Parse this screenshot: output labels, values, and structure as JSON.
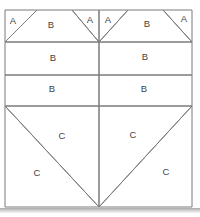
{
  "figure": {
    "kind": "quilt-block-piecing-diagram",
    "canvas": {
      "width": 200,
      "height": 217
    },
    "colors": {
      "background": "#ffffff",
      "line": "#7b7b7b",
      "label": "#3f3f3f",
      "shadow": "#a9a9a9"
    },
    "label_font_size": 9.5,
    "regions": [
      {
        "name": "top-left-corner-triangle",
        "label": "A",
        "points": "5,10 37,10 5,42",
        "lx": 13,
        "ly": 24
      },
      {
        "name": "top-left-trapezoid",
        "label": "B",
        "points": "37,10 72,10 99,42 5,42",
        "lx": 51,
        "ly": 28
      },
      {
        "name": "top-left-inner-triangle",
        "label": "A",
        "points": "72,10 99,10 99,42",
        "lx": 90,
        "ly": 23
      },
      {
        "name": "top-right-inner-triangle",
        "label": "A",
        "points": "99,10 128,10 99,42",
        "lx": 108,
        "ly": 23
      },
      {
        "name": "top-right-trapezoid",
        "label": "B",
        "points": "128,10 163,10 192,42 99,42",
        "lx": 147,
        "ly": 27
      },
      {
        "name": "top-right-corner-triangle",
        "label": "A",
        "points": "163,10 192,10 192,42",
        "lx": 184,
        "ly": 22
      },
      {
        "name": "row1-left-rectangle",
        "label": "B",
        "points": "5,42 99,42 99,75 5,75",
        "lx": 53,
        "ly": 61
      },
      {
        "name": "row1-right-rectangle",
        "label": "B",
        "points": "99,42 192,42 192,75 99,75",
        "lx": 145,
        "ly": 60
      },
      {
        "name": "row2-left-rectangle",
        "label": "B",
        "points": "5,75 99,75 99,106 5,106",
        "lx": 52,
        "ly": 92
      },
      {
        "name": "row2-right-rectangle",
        "label": "B",
        "points": "99,75 192,75 192,106 99,106",
        "lx": 144,
        "ly": 92
      },
      {
        "name": "bottom-left-upper-triangle",
        "label": "C",
        "points": "5,106 99,106 99,207",
        "lx": 62,
        "ly": 139
      },
      {
        "name": "bottom-left-lower-triangle",
        "label": "C",
        "points": "5,106 99,207 5,207",
        "lx": 37,
        "ly": 176
      },
      {
        "name": "bottom-right-upper-triangle",
        "label": "C",
        "points": "99,106 192,106 99,207",
        "lx": 133,
        "ly": 138
      },
      {
        "name": "bottom-right-lower-triangle",
        "label": "C",
        "points": "192,106 192,207 99,207",
        "lx": 166,
        "ly": 175
      }
    ]
  }
}
